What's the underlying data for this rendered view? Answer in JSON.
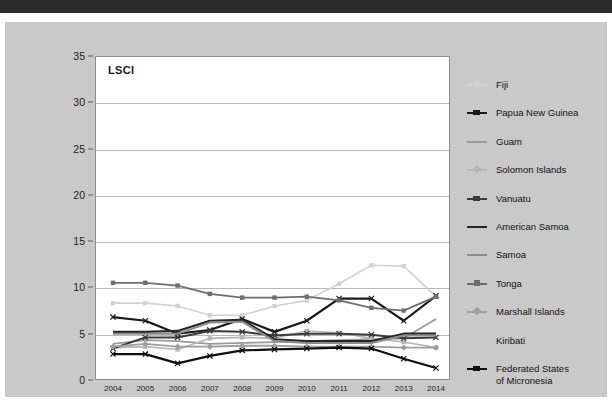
{
  "page": {
    "background_color": "#ffffff",
    "panel_color": "#c9c9c9",
    "top_bar_color": "#2a2a2a"
  },
  "chart_data": {
    "type": "line",
    "title": "LSCI",
    "xlabel": "",
    "ylabel": "",
    "ylim": [
      0,
      35
    ],
    "yticks": [
      0,
      5,
      10,
      15,
      20,
      25,
      30,
      35
    ],
    "grid": true,
    "legend_position": "right",
    "x": [
      2004,
      2005,
      2006,
      2007,
      2008,
      2009,
      2010,
      2011,
      2012,
      2013,
      2014
    ],
    "categories": [
      "2004",
      "2005",
      "2006",
      "2007",
      "2008",
      "2009",
      "2010",
      "2011",
      "2012",
      "2013",
      "2014"
    ],
    "series": [
      {
        "name": "Fiji",
        "color": "#d2d2d2",
        "marker": "square",
        "width": 1.6,
        "values": [
          8.3,
          8.3,
          8.0,
          7.0,
          7.0,
          8.0,
          8.6,
          10.4,
          12.4,
          12.3,
          9.0
        ]
      },
      {
        "name": "Papua New Guinea",
        "color": "#1a1a1a",
        "marker": "cross",
        "width": 2.2,
        "values": [
          6.8,
          6.4,
          5.0,
          5.4,
          6.6,
          5.2,
          6.4,
          8.8,
          8.8,
          6.4,
          9.1
        ]
      },
      {
        "name": "Guam",
        "color": "#9a9a9a",
        "marker": "none",
        "width": 1.8,
        "values": [
          3.9,
          4.3,
          4.2,
          3.9,
          4.0,
          4.1,
          4.2,
          4.3,
          4.4,
          4.5,
          6.6
        ]
      },
      {
        "name": "Solomon Islands",
        "color": "#b5b5b5",
        "marker": "square",
        "width": 1.6,
        "values": [
          3.5,
          3.6,
          3.3,
          4.5,
          4.6,
          4.5,
          5.3,
          5.1,
          4.5,
          4.1,
          3.5
        ]
      },
      {
        "name": "Vanuatu",
        "color": "#3a3a3a",
        "marker": "cross",
        "width": 2.0,
        "values": [
          3.4,
          4.6,
          4.6,
          5.3,
          5.2,
          4.8,
          5.0,
          5.0,
          4.9,
          4.5,
          4.6
        ]
      },
      {
        "name": "American Samoa",
        "color": "#262626",
        "marker": "none",
        "width": 2.2,
        "values": [
          5.2,
          5.2,
          5.3,
          6.4,
          6.5,
          4.4,
          4.2,
          4.2,
          4.2,
          5.0,
          5.0
        ]
      },
      {
        "name": "Samoa",
        "color": "#8c8c8c",
        "marker": "none",
        "width": 2.0,
        "values": [
          5.0,
          5.0,
          5.0,
          6.2,
          6.3,
          4.2,
          4.0,
          4.0,
          4.0,
          4.8,
          4.8
        ]
      },
      {
        "name": "Tonga",
        "color": "#6e6e6e",
        "marker": "square",
        "width": 1.8,
        "values": [
          10.5,
          10.5,
          10.2,
          9.3,
          8.9,
          8.9,
          9.0,
          8.6,
          7.8,
          7.5,
          9.0
        ]
      },
      {
        "name": "Marshall Islands",
        "color": "#9e9e9e",
        "marker": "diamond",
        "width": 1.8,
        "values": [
          3.6,
          3.9,
          3.6,
          3.6,
          3.7,
          3.7,
          3.6,
          3.6,
          3.6,
          3.5,
          3.5
        ]
      },
      {
        "name": "Kiribati",
        "color": "#c9c9c9",
        "marker": "none",
        "width": 0,
        "values": [
          null,
          null,
          null,
          null,
          null,
          null,
          null,
          null,
          null,
          null,
          null
        ]
      },
      {
        "name": "Federated States of Micronesia",
        "color": "#0f0f0f",
        "marker": "cross",
        "width": 2.2,
        "values": [
          2.8,
          2.8,
          1.8,
          2.6,
          3.2,
          3.3,
          3.4,
          3.5,
          3.4,
          2.3,
          1.3
        ]
      }
    ]
  },
  "legend": {
    "items": [
      {
        "label": "Fiji",
        "color": "#d2d2d2",
        "marker": "diamond"
      },
      {
        "label": "Papua New Guinea",
        "color": "#1a1a1a",
        "marker": "cross"
      },
      {
        "label": "Guam",
        "color": "#9a9a9a",
        "marker": "none"
      },
      {
        "label": "Solomon Islands",
        "color": "#b5b5b5",
        "marker": "diamond"
      },
      {
        "label": "Vanuatu",
        "color": "#3a3a3a",
        "marker": "cross"
      },
      {
        "label": "American Samoa",
        "color": "#262626",
        "marker": "none"
      },
      {
        "label": "Samoa",
        "color": "#8c8c8c",
        "marker": "none"
      },
      {
        "label": "Tonga",
        "color": "#6e6e6e",
        "marker": "square"
      },
      {
        "label": "Marshall Islands",
        "color": "#9e9e9e",
        "marker": "diamond"
      },
      {
        "label": "Kiribati",
        "color": "#c9c9c9",
        "marker": "none"
      },
      {
        "label": "Federated States\nof Micronesia",
        "color": "#0f0f0f",
        "marker": "cross"
      }
    ]
  }
}
